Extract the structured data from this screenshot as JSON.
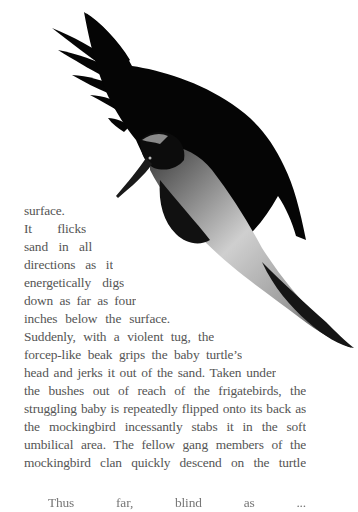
{
  "figure": {
    "colors": {
      "plumage": "#050505",
      "belly": "#c8c8c8",
      "background": "#ffffff"
    }
  },
  "body_text": {
    "color": "#555555",
    "lines": [
      "surface.",
      "It  flicks",
      "sand  in  all",
      "directions  as  it",
      "energetically  digs",
      "down  as  far  as  four",
      "inches  below  the  surface.",
      "Suddenly, with a violent tug, the",
      "forcep-like beak grips the baby turtle’s",
      "head and jerks it out of the sand. Taken under",
      "the bushes out of reach of the frigatebirds, the",
      "struggling baby is repeatedly flipped onto its back as",
      "the mockingbird incessantly stabs it in the soft",
      "umbilical area. The fellow gang members of the",
      "mockingbird clan quickly descend on the turtle"
    ],
    "next_paragraph_partial": "Thus far, blind as ..."
  }
}
